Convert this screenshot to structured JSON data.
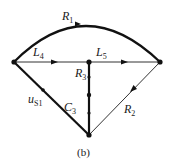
{
  "caption": "(b)",
  "nodes": [
    {
      "id": "left",
      "x": 14,
      "y": 62
    },
    {
      "id": "center",
      "x": 89,
      "y": 62
    },
    {
      "id": "right",
      "x": 160,
      "y": 62
    },
    {
      "id": "bottom",
      "x": 89,
      "y": 135
    }
  ],
  "branches": [
    {
      "id": "R1",
      "label": "R",
      "sub": "1",
      "from": "left",
      "to": "right",
      "shape": "arc"
    },
    {
      "id": "L4",
      "label": "L",
      "sub": "4",
      "from": "left",
      "to": "center"
    },
    {
      "id": "L5",
      "label": "L",
      "sub": "5",
      "from": "center",
      "to": "right"
    },
    {
      "id": "R3",
      "label": "R",
      "sub": "3",
      "from": "center",
      "to": "bottom"
    },
    {
      "id": "C3",
      "label": "C",
      "sub": "3",
      "from": "left",
      "to": "bottom"
    },
    {
      "id": "uS1",
      "label": "u",
      "sub": "S1",
      "from": "left",
      "to": "bottom"
    },
    {
      "id": "R2",
      "label": "R",
      "sub": "2",
      "from": "right",
      "to": "bottom"
    }
  ]
}
